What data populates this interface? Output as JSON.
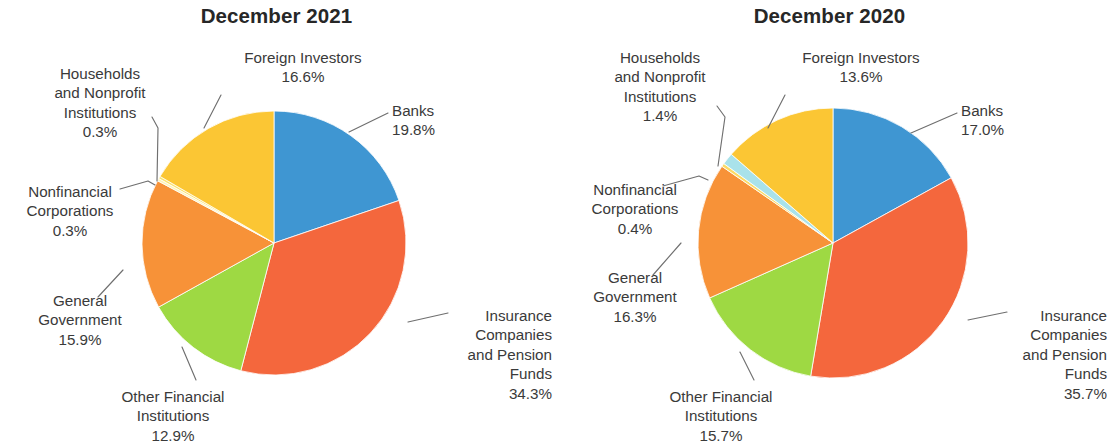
{
  "figure": {
    "background": "#ffffff",
    "width": 1106,
    "height": 443
  },
  "palette": {
    "banks": "#3f96d2",
    "insurance": "#f4673d",
    "other_financial": "#9ed943",
    "general_government": "#f79238",
    "nonfinancial_corporations_2021": "#fdf3b9",
    "households_2021": "#fbe36f",
    "nonfinancial_corporations_2020": "#fbdb66",
    "households_2020": "#a9e2ea",
    "foreign_investors": "#fbc634",
    "leader_line": "#6f6f6f",
    "text": "#3a3a3a",
    "title": "#272727"
  },
  "charts": [
    {
      "id": "december-2021",
      "title": "December 2021",
      "center_x": 274,
      "center_y": 243,
      "radius": 132,
      "labels": [
        {
          "key": "foreign-investors",
          "name": "Foreign Investors",
          "percent": "16.6%",
          "align": "center",
          "x": 228,
          "y": 48,
          "width": 150,
          "leader": [
            [
              221,
              95
            ],
            [
              204,
              128
            ]
          ]
        },
        {
          "key": "banks",
          "name": "Banks",
          "percent": "19.8%",
          "align": "left",
          "x": 392,
          "y": 101,
          "width": 130,
          "leader": [
            [
              388,
              113
            ],
            [
              349,
              132
            ]
          ]
        },
        {
          "key": "insurance-companies-and-pension-funds",
          "name": "Insurance\nCompanies\nand Pension\nFunds",
          "percent": "34.3%",
          "align": "right",
          "x": 400,
          "y": 306,
          "width": 152,
          "leader": [
            [
              448,
              313
            ],
            [
              408,
              322
            ]
          ]
        },
        {
          "key": "other-financial-institutions",
          "name": "Other Financial\nInstitutions",
          "percent": "12.9%",
          "align": "center",
          "x": 98,
          "y": 387,
          "width": 150,
          "leader": [
            [
              196,
              380
            ],
            [
              182,
              347
            ]
          ]
        },
        {
          "key": "general-government",
          "name": "General\nGovernment",
          "percent": "15.9%",
          "align": "center",
          "x": 10,
          "y": 291,
          "width": 140,
          "leader": [
            [
              98,
              297
            ],
            [
              123,
              270
            ]
          ]
        },
        {
          "key": "nonfinancial-corporations",
          "name": "Nonfinancial\nCorporations",
          "percent": "0.3%",
          "align": "center",
          "x": 0,
          "y": 182,
          "width": 140,
          "leader": [
            [
              120,
              189
            ],
            [
              148,
              181
            ],
            [
              155,
              185
            ]
          ]
        },
        {
          "key": "households-and-nonprofit-institutions",
          "name": "Households\nand Nonprofit\nInstitutions",
          "percent": "0.3%",
          "align": "center",
          "x": 20,
          "y": 64,
          "width": 160,
          "leader": [
            [
              152,
              117
            ],
            [
              158,
              128
            ],
            [
              157,
              181
            ]
          ]
        }
      ],
      "slices": [
        {
          "key": "banks",
          "label": "Banks",
          "value": 19.8,
          "color": "#3f96d2"
        },
        {
          "key": "insurance-companies-and-pension-funds",
          "label": "Insurance Companies and Pension Funds",
          "value": 34.3,
          "color": "#f4673d"
        },
        {
          "key": "other-financial-institutions",
          "label": "Other Financial Institutions",
          "value": 12.9,
          "color": "#9ed943"
        },
        {
          "key": "general-government",
          "label": "General Government",
          "value": 15.9,
          "color": "#f79238"
        },
        {
          "key": "nonfinancial-corporations",
          "label": "Nonfinancial Corporations",
          "value": 0.3,
          "color": "#fdf3b9"
        },
        {
          "key": "households-and-nonprofit-institutions",
          "label": "Households and Nonprofit Institutions",
          "value": 0.3,
          "color": "#fbe36f"
        },
        {
          "key": "foreign-investors",
          "label": "Foreign Investors",
          "value": 16.6,
          "color": "#fbc634"
        }
      ]
    },
    {
      "id": "december-2020",
      "title": "December 2020",
      "center_x": 280,
      "center_y": 243,
      "radius": 135,
      "labels": [
        {
          "key": "foreign-investors",
          "name": "Foreign Investors",
          "percent": "13.6%",
          "align": "center",
          "x": 228,
          "y": 48,
          "width": 160,
          "leader": [
            [
              232,
              95
            ],
            [
              215,
              128
            ]
          ]
        },
        {
          "key": "banks",
          "name": "Banks",
          "percent": "17.0%",
          "align": "left",
          "x": 408,
          "y": 101,
          "width": 130,
          "leader": [
            [
              404,
              113
            ],
            [
              358,
              133
            ]
          ]
        },
        {
          "key": "insurance-companies-and-pension-funds",
          "name": "Insurance\nCompanies\nand Pension\nFunds",
          "percent": "35.7%",
          "align": "right",
          "x": 404,
          "y": 306,
          "width": 150,
          "leader": [
            [
              454,
              312
            ],
            [
              415,
              320
            ]
          ]
        },
        {
          "key": "other-financial-institutions",
          "name": "Other Financial\nInstitutions",
          "percent": "15.7%",
          "align": "center",
          "x": 78,
          "y": 387,
          "width": 180,
          "leader": [
            [
              201,
              380
            ],
            [
              187,
              352
            ]
          ]
        },
        {
          "key": "general-government",
          "name": "General\nGovernment",
          "percent": "16.3%",
          "align": "center",
          "x": 2,
          "y": 268,
          "width": 160,
          "leader": [
            [
              100,
              275
            ],
            [
              128,
              243
            ]
          ]
        },
        {
          "key": "nonfinancial-corporations",
          "name": "Nonfinancial\nCorporations",
          "percent": "0.4%",
          "align": "center",
          "x": 2,
          "y": 180,
          "width": 160,
          "leader": [
            [
              110,
              186
            ],
            [
              146,
              176
            ],
            [
              155,
              180
            ]
          ]
        },
        {
          "key": "households-and-nonprofit-institutions",
          "name": "Households\nand Nonprofit\nInstitutions",
          "percent": "1.4%",
          "align": "center",
          "x": 22,
          "y": 48,
          "width": 170,
          "leader": [
            [
              164,
              106
            ],
            [
              172,
              117
            ],
            [
              165,
              166
            ]
          ]
        }
      ],
      "slices": [
        {
          "key": "banks",
          "label": "Banks",
          "value": 17.0,
          "color": "#3f96d2"
        },
        {
          "key": "insurance-companies-and-pension-funds",
          "label": "Insurance Companies and Pension Funds",
          "value": 35.7,
          "color": "#f4673d"
        },
        {
          "key": "other-financial-institutions",
          "label": "Other Financial Institutions",
          "value": 15.7,
          "color": "#9ed943"
        },
        {
          "key": "general-government",
          "label": "General Government",
          "value": 16.3,
          "color": "#f79238"
        },
        {
          "key": "nonfinancial-corporations",
          "label": "Nonfinancial Corporations",
          "value": 0.4,
          "color": "#fbdb66"
        },
        {
          "key": "households-and-nonprofit-institutions",
          "label": "Households and Nonprofit Institutions",
          "value": 1.4,
          "color": "#a9e2ea"
        },
        {
          "key": "foreign-investors",
          "label": "Foreign Investors",
          "value": 13.6,
          "color": "#fbc634"
        }
      ]
    }
  ],
  "chart_data": [
    {
      "type": "pie",
      "title": "December 2021",
      "categories": [
        "Banks",
        "Insurance Companies and Pension Funds",
        "Other Financial Institutions",
        "General Government",
        "Nonfinancial Corporations",
        "Households and Nonprofit Institutions",
        "Foreign Investors"
      ],
      "values": [
        19.8,
        34.3,
        12.9,
        15.9,
        0.3,
        0.3,
        16.6
      ],
      "value_labels": [
        "19.8%",
        "34.3%",
        "12.9%",
        "15.9%",
        "0.3%",
        "0.3%",
        "16.6%"
      ],
      "units": "percent",
      "start_angle_deg": 0,
      "direction": "clockwise",
      "legend": "none",
      "annotations": "leader-line callouts outside pie",
      "colors": [
        "#3f96d2",
        "#f4673d",
        "#9ed943",
        "#f79238",
        "#fdf3b9",
        "#fbe36f",
        "#fbc634"
      ]
    },
    {
      "type": "pie",
      "title": "December 2020",
      "categories": [
        "Banks",
        "Insurance Companies and Pension Funds",
        "Other Financial Institutions",
        "General Government",
        "Nonfinancial Corporations",
        "Households and Nonprofit Institutions",
        "Foreign Investors"
      ],
      "values": [
        17.0,
        35.7,
        15.7,
        16.3,
        0.4,
        1.4,
        13.6
      ],
      "value_labels": [
        "17.0%",
        "35.7%",
        "15.7%",
        "16.3%",
        "0.4%",
        "1.4%",
        "13.6%"
      ],
      "units": "percent",
      "start_angle_deg": 0,
      "direction": "clockwise",
      "legend": "none",
      "annotations": "leader-line callouts outside pie",
      "colors": [
        "#3f96d2",
        "#f4673d",
        "#9ed943",
        "#f79238",
        "#fbdb66",
        "#a9e2ea",
        "#fbc634"
      ]
    }
  ]
}
